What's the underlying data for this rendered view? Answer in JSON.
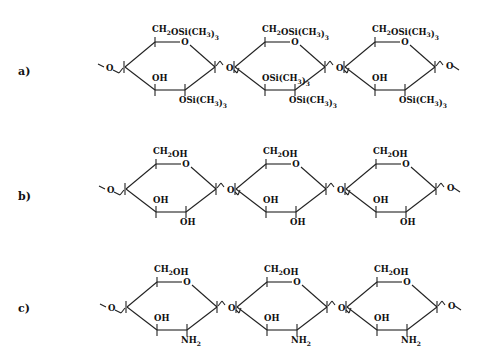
{
  "figure": {
    "type": "chemical-structure-comparison",
    "rows": [
      {
        "label": "a)",
        "description": "trimethylsilylated polysaccharide chain",
        "units": [
          {
            "top": "CH2OSi(CH3)3",
            "ring_o": "O",
            "mid": "OH",
            "bottom": "OSi(CH3)3"
          },
          {
            "top": "CH2OSi(CH3)3",
            "ring_o": "O",
            "mid": "OSi(CH3)3",
            "bottom": "OSi(CH3)3"
          },
          {
            "top": "CH2OSi(CH3)3",
            "ring_o": "O",
            "mid": "OH",
            "bottom": "OSi(CH3)3"
          }
        ],
        "linker": "O"
      },
      {
        "label": "b)",
        "description": "cellulose chain",
        "units": [
          {
            "top": "CH2OH",
            "ring_o": "O",
            "mid": "OH",
            "bottom": "OH"
          },
          {
            "top": "CH2OH",
            "ring_o": "O",
            "mid": "OH",
            "bottom": "OH"
          },
          {
            "top": "CH2OH",
            "ring_o": "O",
            "mid": "OH",
            "bottom": "OH"
          }
        ],
        "linker": "O"
      },
      {
        "label": "c)",
        "description": "chitosan chain",
        "units": [
          {
            "top": "CH2OH",
            "ring_o": "O",
            "mid": "OH",
            "bottom": "NH2"
          },
          {
            "top": "CH2OH",
            "ring_o": "O",
            "mid": "OH",
            "bottom": "NH2"
          },
          {
            "top": "CH2OH",
            "ring_o": "O",
            "mid": "OH",
            "bottom": "NH2"
          }
        ],
        "linker": "O"
      }
    ]
  }
}
